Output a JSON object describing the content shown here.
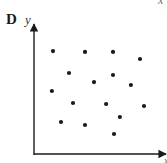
{
  "figure": {
    "panel_label": "D",
    "y_axis_label": "y",
    "x_axis_label": "x",
    "x_axis_label_top_fragment": "x"
  },
  "colors": {
    "axis": "#1a1a1a",
    "points": "#1a1a1a",
    "background": "#ffffff"
  },
  "chart_data": {
    "type": "scatter",
    "title": "D",
    "xlabel": "x",
    "ylabel": "y",
    "xlim": [
      0,
      10
    ],
    "ylim": [
      0,
      10
    ],
    "grid": false,
    "legend": null,
    "ticks": "none",
    "series": [
      {
        "name": "points",
        "x": [
          1.45,
          3.89,
          6.03,
          8.09,
          2.67,
          6.03,
          4.58,
          7.4,
          1.37,
          2.98,
          5.5,
          8.4,
          6.56,
          2.06,
          3.89,
          6.11
        ],
        "y": [
          8.17,
          8.1,
          8.1,
          7.54,
          6.43,
          6.27,
          5.71,
          5.48,
          5.0,
          4.05,
          3.97,
          3.81,
          2.94,
          2.54,
          2.3,
          1.59
        ]
      }
    ]
  }
}
